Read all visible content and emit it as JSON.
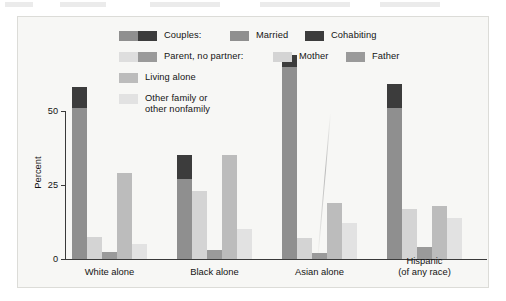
{
  "chart_data": {
    "type": "bar",
    "title": "",
    "subtitle": "",
    "xlabel": "",
    "ylabel": "Percent",
    "ylim": [
      0,
      75
    ],
    "yticks": [
      0,
      25,
      50
    ],
    "ytick_labels": [
      "0",
      "25",
      "50"
    ],
    "grid": false,
    "legend_position": "top",
    "stacked_groups": true,
    "categories": [
      "White alone",
      "Black alone",
      "Asian alone",
      "Hispanic (of any race)"
    ],
    "category_lines": [
      [
        "White alone"
      ],
      [
        "Black alone"
      ],
      [
        "Asian alone"
      ],
      [
        "Hispanic",
        "(of any race)"
      ]
    ],
    "series": [
      {
        "name": "Married",
        "color": "#8f8f8f",
        "values": [
          51,
          27,
          65,
          51
        ]
      },
      {
        "name": "Cohabiting",
        "color": "#3c3c3c",
        "values": [
          7,
          8,
          4,
          8
        ]
      },
      {
        "name": "Mother",
        "color": "#d4d4d4",
        "values": [
          7.5,
          23,
          7,
          17
        ]
      },
      {
        "name": "Father",
        "color": "#9a9a9a",
        "values": [
          2.5,
          3,
          2,
          4
        ]
      },
      {
        "name": "Living alone",
        "color": "#bcbcbc",
        "values": [
          29,
          35,
          19,
          18
        ]
      },
      {
        "name": "Other family or other nonfamily",
        "color": "#e2e2e2",
        "values": [
          5,
          10,
          12,
          14
        ]
      }
    ],
    "bars_per_group": [
      {
        "group": "White alone",
        "bars": [
          {
            "label": "Couples",
            "stack": [
              {
                "series": "Married",
                "value": 51
              },
              {
                "series": "Cohabiting",
                "value": 7
              }
            ],
            "total": 58
          },
          {
            "label": "Mother",
            "value": 7.5
          },
          {
            "label": "Father",
            "value": 2.5
          },
          {
            "label": "Living alone",
            "value": 29
          },
          {
            "label": "Other family or other nonfamily",
            "value": 5
          }
        ]
      },
      {
        "group": "Black alone",
        "bars": [
          {
            "label": "Couples",
            "stack": [
              {
                "series": "Married",
                "value": 27
              },
              {
                "series": "Cohabiting",
                "value": 8
              }
            ],
            "total": 35
          },
          {
            "label": "Mother",
            "value": 23
          },
          {
            "label": "Father",
            "value": 3
          },
          {
            "label": "Living alone",
            "value": 35
          },
          {
            "label": "Other family or other nonfamily",
            "value": 10
          }
        ]
      },
      {
        "group": "Asian alone",
        "bars": [
          {
            "label": "Couples",
            "stack": [
              {
                "series": "Married",
                "value": 65
              },
              {
                "series": "Cohabiting",
                "value": 4
              }
            ],
            "total": 69
          },
          {
            "label": "Mother",
            "value": 7
          },
          {
            "label": "Father",
            "value": 2
          },
          {
            "label": "Living alone",
            "value": 19
          },
          {
            "label": "Other family or other nonfamily",
            "value": 12
          }
        ]
      },
      {
        "group": "Hispanic (of any race)",
        "bars": [
          {
            "label": "Couples",
            "stack": [
              {
                "series": "Married",
                "value": 51
              },
              {
                "series": "Cohabiting",
                "value": 8
              }
            ],
            "total": 59
          },
          {
            "label": "Mother",
            "value": 17
          },
          {
            "label": "Father",
            "value": 4
          },
          {
            "label": "Living alone",
            "value": 18
          },
          {
            "label": "Other family or other nonfamily",
            "value": 14
          }
        ]
      }
    ]
  },
  "legend": {
    "rows": [
      {
        "id": "couples",
        "swatches": [
          "#8f8f8f",
          "#3c3c3c"
        ],
        "label": "Couples:",
        "items": [
          {
            "swatch": "#8f8f8f",
            "label": "Married"
          },
          {
            "swatch": "#3c3c3c",
            "label": "Cohabiting"
          }
        ]
      },
      {
        "id": "parent-no-partner",
        "swatches": [
          "#dedede",
          "#9a9a9a"
        ],
        "label": "Parent, no partner:",
        "items": [
          {
            "swatch": "#d4d4d4",
            "label": "Mother"
          },
          {
            "swatch": "#9a9a9a",
            "label": "Father"
          }
        ]
      },
      {
        "id": "living-alone",
        "swatches": [
          "#bcbcbc"
        ],
        "label": "Living alone",
        "items": []
      },
      {
        "id": "other-family",
        "swatches": [
          "#e2e2e2"
        ],
        "label_line1": "Other family or",
        "label_line2": "other nonfamily",
        "items": []
      }
    ]
  },
  "axes": {
    "y_title": "Percent",
    "y_tick_labels": [
      "50",
      "25",
      "0"
    ]
  },
  "colors": {
    "married": "#8f8f8f",
    "cohabiting": "#3c3c3c",
    "mother": "#d4d4d4",
    "father": "#9a9a9a",
    "living_alone": "#bcbcbc",
    "other_family": "#e2e2e2",
    "axis": "#3a3a3a",
    "panel_bg": "#f7f7f5",
    "panel_border": "#dcdcd8",
    "text": "#141414"
  }
}
